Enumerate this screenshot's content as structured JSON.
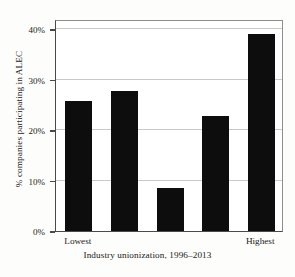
{
  "chart_data": {
    "type": "bar",
    "title": "",
    "xlabel": "Industry unionization, 1996–2013",
    "ylabel": "% companies participating in ALEC",
    "categories": [
      "Lowest",
      "",
      "",
      "",
      "Highest"
    ],
    "category_labels_shown": [
      "Lowest",
      "Highest"
    ],
    "values": [
      25.7,
      27.8,
      8.5,
      22.7,
      39.0
    ],
    "ylim": [
      0,
      42
    ],
    "yticks": [
      0,
      10,
      20,
      30,
      40
    ],
    "ytick_labels": [
      "0%",
      "10%",
      "20%",
      "30%",
      "40%"
    ],
    "grid": true,
    "grid_axis": "y",
    "legend": "none",
    "bar_color": "#0d0d0d",
    "grid_color": "#c9c9c9",
    "axis_color": "#4a4a4a",
    "background": "#ffffff"
  }
}
